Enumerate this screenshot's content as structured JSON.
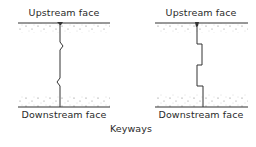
{
  "diagram": {
    "caption": "Keyways",
    "panels": [
      {
        "id": "left",
        "top_label": "Upstream face",
        "bottom_label": "Downstream face",
        "joint_type": "v-notch keyway"
      },
      {
        "id": "right",
        "top_label": "Upstream face",
        "bottom_label": "Downstream face",
        "joint_type": "rectangular keyway"
      }
    ]
  }
}
